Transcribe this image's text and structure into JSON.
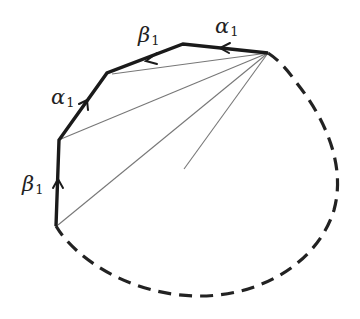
{
  "diagram": {
    "colors": {
      "edge": "#1a1a1a",
      "diagonal": "#777777",
      "dashed": "#222222",
      "background": "#ffffff"
    },
    "labels": {
      "top_right_edge": {
        "greek": "α",
        "subscript": "1"
      },
      "top_middle_edge": {
        "greek": "β",
        "subscript": "1"
      },
      "left_upper_edge": {
        "greek": "α",
        "subscript": "1"
      },
      "left_lower_edge": {
        "greek": "β",
        "subscript": "1"
      }
    },
    "vertices": [
      {
        "id": "apex",
        "x": 268,
        "y": 53
      },
      {
        "id": "v1",
        "x": 183,
        "y": 44
      },
      {
        "id": "v2",
        "x": 107,
        "y": 73
      },
      {
        "id": "v3",
        "x": 59,
        "y": 140
      },
      {
        "id": "v4",
        "x": 56,
        "y": 226
      }
    ],
    "edges": [
      {
        "from": "apex",
        "to": "v1",
        "label": "α1",
        "arrow": "toward v1"
      },
      {
        "from": "v1",
        "to": "v2",
        "label": "β1",
        "arrow": "toward v2"
      },
      {
        "from": "v3",
        "to": "v2",
        "label": "α1",
        "arrow": "toward v2"
      },
      {
        "from": "v4",
        "to": "v3",
        "label": "β1",
        "arrow": "toward v3"
      }
    ],
    "diagonals_from_apex": 5,
    "dashed_curve": "from apex around right and bottom back to v4"
  }
}
